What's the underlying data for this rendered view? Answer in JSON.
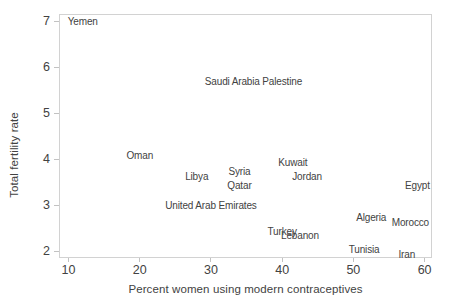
{
  "figure": {
    "background": "#ffffff",
    "text_color": "#424242",
    "axis_line_color": "#d2d2d2",
    "tick_mark_color": "#c2c2c2"
  },
  "chart_data": {
    "type": "scatter",
    "title": "",
    "xlabel": "Percent women using modern contraceptives",
    "ylabel": "Total fertility rate",
    "xlim": [
      8.8,
      60.9
    ],
    "ylim": [
      1.88,
      7.14
    ],
    "x_ticks": [
      10,
      20,
      30,
      40,
      50,
      60
    ],
    "y_ticks": [
      2,
      3,
      4,
      5,
      6,
      7
    ],
    "grid": false,
    "legend": "none",
    "point_style": "text-label-only",
    "points": [
      {
        "label": "Yemen",
        "x": 12,
        "y": 7.0
      },
      {
        "label": "Saudi Arabia",
        "x": 33,
        "y": 5.7
      },
      {
        "label": "Palestine",
        "x": 40,
        "y": 5.7
      },
      {
        "label": "Oman",
        "x": 20,
        "y": 4.1
      },
      {
        "label": "Kuwait",
        "x": 41.5,
        "y": 3.95
      },
      {
        "label": "Syria",
        "x": 34,
        "y": 3.75
      },
      {
        "label": "Libya",
        "x": 28,
        "y": 3.65
      },
      {
        "label": "Jordan",
        "x": 43.5,
        "y": 3.65
      },
      {
        "label": "Qatar",
        "x": 34,
        "y": 3.45
      },
      {
        "label": "Egypt",
        "x": 59,
        "y": 3.45
      },
      {
        "label": "United Arab Emirates",
        "x": 30,
        "y": 3.0
      },
      {
        "label": "Algeria",
        "x": 52.5,
        "y": 2.75
      },
      {
        "label": "Morocco",
        "x": 58,
        "y": 2.65
      },
      {
        "label": "Turkey",
        "x": 40,
        "y": 2.45
      },
      {
        "label": "Lebanon",
        "x": 42.5,
        "y": 2.35
      },
      {
        "label": "Tunisia",
        "x": 51.5,
        "y": 2.05
      },
      {
        "label": "Iran",
        "x": 57.5,
        "y": 1.95
      }
    ]
  }
}
